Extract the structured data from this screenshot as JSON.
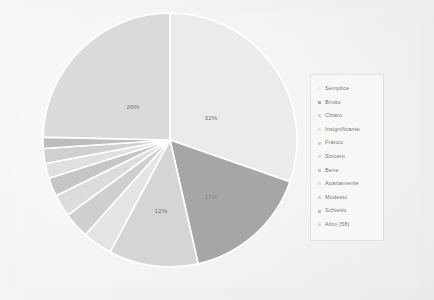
{
  "chart_data": {
    "type": "pie",
    "title": "",
    "legend_position": "right",
    "categories": [
      "Semplice",
      "Brutto",
      "Chiaro",
      "Insignificante",
      "Franco",
      "Sincero",
      "Bene",
      "Apartamente",
      "Modesto",
      "Schietto",
      "Altro (58)"
    ],
    "values": [
      32,
      17,
      12,
      4,
      3.5,
      3,
      2.5,
      2,
      2,
      1.5,
      26
    ],
    "value_labels": [
      "32%",
      "17%",
      "12%",
      "",
      "",
      "",
      "",
      "",
      "",
      "",
      "26%"
    ],
    "colors": [
      "#ebebea",
      "#a6a6a4",
      "#d5d5d3",
      "#e4e4e2",
      "#cfcfcd",
      "#dcdcda",
      "#c6c6c4",
      "#e0e0de",
      "#d0d0ce",
      "#bdbdbb",
      "#dadad8"
    ],
    "slice_separator_color": "#ffffff",
    "labels_shown": [
      "32%",
      "26%",
      "17%",
      "12%"
    ]
  },
  "legend": {
    "items": [
      {
        "label": "Semplice",
        "color": "#ebebea"
      },
      {
        "label": "Brutto",
        "color": "#a6a6a4"
      },
      {
        "label": "Chiaro",
        "color": "#d5d5d3"
      },
      {
        "label": "Insignificante",
        "color": "#e4e4e2"
      },
      {
        "label": "Franco",
        "color": "#cfcfcd"
      },
      {
        "label": "Sincero",
        "color": "#dcdcda"
      },
      {
        "label": "Bene",
        "color": "#c6c6c4"
      },
      {
        "label": "Apartamente",
        "color": "#e0e0de"
      },
      {
        "label": "Modesto",
        "color": "#d0d0ce"
      },
      {
        "label": "Schietto",
        "color": "#bdbdbb"
      },
      {
        "label": "Altro (58)",
        "color": "#dadad8"
      }
    ]
  },
  "slice_labels": [
    {
      "text": "32%",
      "x": 211,
      "y": 117
    },
    {
      "text": "26%",
      "x": 133,
      "y": 106
    },
    {
      "text": "17%",
      "x": 211,
      "y": 196
    },
    {
      "text": "12%",
      "x": 161,
      "y": 210
    }
  ]
}
